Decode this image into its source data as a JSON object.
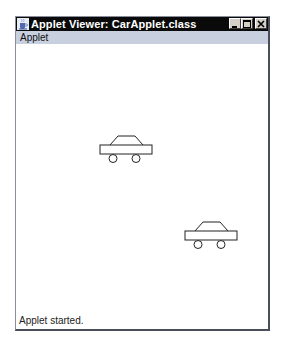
{
  "window": {
    "title": "Applet Viewer: CarApplet.class",
    "icon": "java-coffee-cup-icon",
    "controls": {
      "minimize": "_",
      "maximize": "□",
      "close": "×"
    }
  },
  "menubar": {
    "items": [
      {
        "label": "Applet"
      }
    ]
  },
  "applet": {
    "cars": [
      {
        "label": "car-1",
        "x": 84,
        "y": 100
      },
      {
        "label": "car-2",
        "x": 169,
        "y": 186
      }
    ]
  },
  "status": {
    "text": "Applet started."
  },
  "colors": {
    "titlebar": "#0a0a0a",
    "menubar": "#c8d0e0",
    "content": "#ffffff",
    "stroke": "#222222"
  }
}
